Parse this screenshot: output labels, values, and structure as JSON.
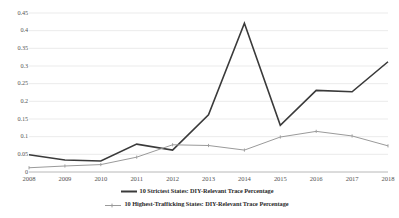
{
  "chart_data": {
    "type": "line",
    "title": "",
    "subtitle": "",
    "xlabel": "",
    "ylabel": "",
    "grid": "horizontal",
    "legend_position": "bottom",
    "categories": [
      "2008",
      "2009",
      "2010",
      "2011",
      "2012",
      "2013",
      "2014",
      "2015",
      "2016",
      "2017",
      "2018"
    ],
    "x": [
      2008,
      2009,
      2010,
      2011,
      2012,
      2013,
      2014,
      2015,
      2016,
      2017,
      2018
    ],
    "xlim": [
      2008,
      2018
    ],
    "ylim": [
      0,
      0.45
    ],
    "yticks": [
      "0",
      "0.05",
      "0.1",
      "0.15",
      "0.2",
      "0.25",
      "0.3",
      "0.35",
      "0.4",
      "0.45"
    ],
    "ytick_values": [
      0,
      0.05,
      0.1,
      0.15,
      0.2,
      0.25,
      0.3,
      0.35,
      0.4,
      0.45
    ],
    "series": [
      {
        "name": "10 Strictest States: DIY-Relevant Trace Percentage",
        "color": "#3a3a3a",
        "width": 1.6,
        "marker": "none",
        "values": [
          0.049,
          0.034,
          0.031,
          0.079,
          0.062,
          0.162,
          0.421,
          0.132,
          0.231,
          0.227,
          0.312
        ]
      },
      {
        "name": "10 Highest-Trafficking States: DIY-Relevant Trace Percentage",
        "color": "#9a9a9a",
        "width": 1.0,
        "marker": "none",
        "values": [
          0.012,
          0.017,
          0.021,
          0.042,
          0.077,
          0.075,
          0.062,
          0.099,
          0.115,
          0.102,
          0.074
        ]
      }
    ]
  },
  "legend": {
    "items": [
      {
        "label": "10 Strictest States: DIY-Relevant Trace Percentage",
        "color": "#3a3a3a"
      },
      {
        "label": "10 Highest-Trafficking States: DIY-Relevant Trace Percentage",
        "color": "#9a9a9a"
      }
    ]
  },
  "axis": {
    "y_labels": [
      "0.45",
      "0.4",
      "0.35",
      "0.3",
      "0.25",
      "0.2",
      "0.15",
      "0.1",
      "0.05",
      "0"
    ],
    "x_labels": [
      "2008",
      "2009",
      "2010",
      "2011",
      "2012",
      "2013",
      "2014",
      "2015",
      "2016",
      "2017",
      "2018"
    ]
  }
}
